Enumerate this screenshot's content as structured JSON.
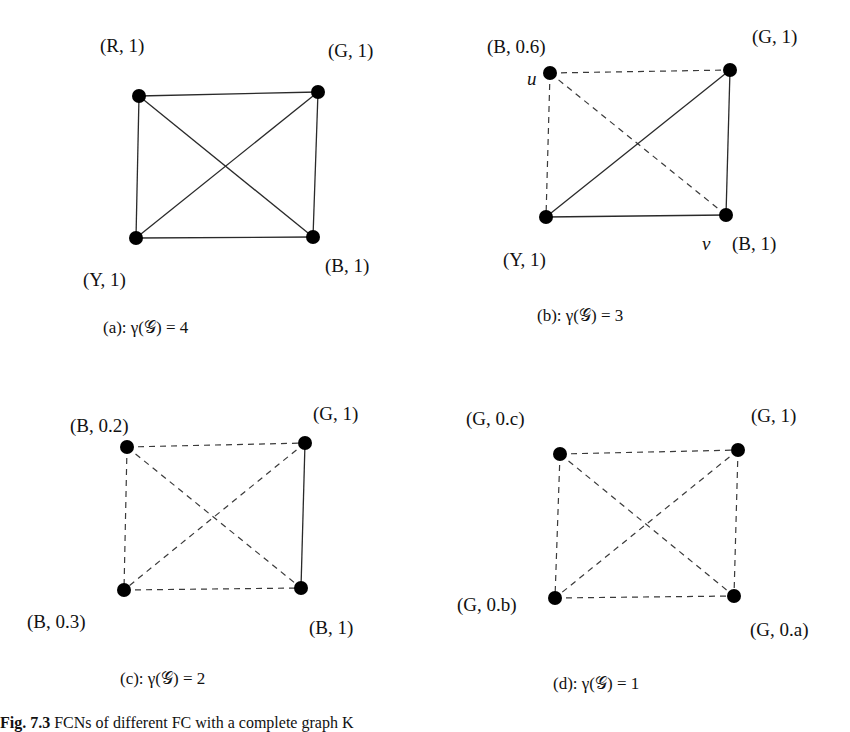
{
  "figure": {
    "caption_prefix": "Fig. 7.3",
    "caption_text": " FCNs of different FC with a complete graph K"
  },
  "panels": [
    {
      "id": "a",
      "caption": "(a): γ(𝒢) = 4",
      "nodes": [
        {
          "id": "tl",
          "x": 139,
          "y": 96,
          "label": "(R, 1)",
          "lx": 100,
          "ly": 52
        },
        {
          "id": "tr",
          "x": 318,
          "y": 92,
          "label": "(G, 1)",
          "lx": 328,
          "ly": 57
        },
        {
          "id": "bl",
          "x": 136,
          "y": 238,
          "label": "(Y, 1)",
          "lx": 83,
          "ly": 286
        },
        {
          "id": "br",
          "x": 313,
          "y": 237,
          "label": "(B, 1)",
          "lx": 325,
          "ly": 272
        }
      ],
      "edges": [
        {
          "from": "tl",
          "to": "tr",
          "style": "solid"
        },
        {
          "from": "tl",
          "to": "bl",
          "style": "solid"
        },
        {
          "from": "tl",
          "to": "br",
          "style": "solid"
        },
        {
          "from": "tr",
          "to": "bl",
          "style": "solid"
        },
        {
          "from": "tr",
          "to": "br",
          "style": "solid"
        },
        {
          "from": "bl",
          "to": "br",
          "style": "solid"
        }
      ],
      "caption_x": 103,
      "caption_y": 333
    },
    {
      "id": "b",
      "caption": "(b): γ(𝒢) = 3",
      "nodes": [
        {
          "id": "tl",
          "x": 550,
          "y": 73,
          "label": "(B, 0.6)",
          "lx": 487,
          "ly": 53,
          "extra": "u",
          "ex": 527,
          "ey": 85
        },
        {
          "id": "tr",
          "x": 730,
          "y": 70,
          "label": "(G, 1)",
          "lx": 752,
          "ly": 43
        },
        {
          "id": "bl",
          "x": 546,
          "y": 217,
          "label": "(Y, 1)",
          "lx": 503,
          "ly": 266
        },
        {
          "id": "br",
          "x": 726,
          "y": 215,
          "label": "(B, 1)",
          "lx": 732,
          "ly": 250,
          "extra": "v",
          "ex": 702,
          "ey": 250
        }
      ],
      "edges": [
        {
          "from": "tl",
          "to": "tr",
          "style": "dashed"
        },
        {
          "from": "tl",
          "to": "bl",
          "style": "dashed"
        },
        {
          "from": "tl",
          "to": "br",
          "style": "dashed"
        },
        {
          "from": "tr",
          "to": "bl",
          "style": "solid"
        },
        {
          "from": "tr",
          "to": "br",
          "style": "solid"
        },
        {
          "from": "bl",
          "to": "br",
          "style": "solid"
        }
      ],
      "caption_x": 537,
      "caption_y": 321
    },
    {
      "id": "c",
      "caption": "(c): γ(𝒢) = 2",
      "nodes": [
        {
          "id": "tl",
          "x": 127,
          "y": 447,
          "label": "(B, 0.2)",
          "lx": 70,
          "ly": 432
        },
        {
          "id": "tr",
          "x": 305,
          "y": 443,
          "label": "(G, 1)",
          "lx": 313,
          "ly": 420
        },
        {
          "id": "bl",
          "x": 124,
          "y": 590,
          "label": "(B, 0.3)",
          "lx": 27,
          "ly": 628
        },
        {
          "id": "br",
          "x": 301,
          "y": 588,
          "label": "(B, 1)",
          "lx": 309,
          "ly": 634
        }
      ],
      "edges": [
        {
          "from": "tl",
          "to": "tr",
          "style": "dashed"
        },
        {
          "from": "tl",
          "to": "bl",
          "style": "dashed"
        },
        {
          "from": "tl",
          "to": "br",
          "style": "dashed"
        },
        {
          "from": "tr",
          "to": "bl",
          "style": "dashed"
        },
        {
          "from": "tr",
          "to": "br",
          "style": "solid"
        },
        {
          "from": "bl",
          "to": "br",
          "style": "dashed"
        }
      ],
      "caption_x": 120,
      "caption_y": 684
    },
    {
      "id": "d",
      "caption": "(d): γ(𝒢) = 1",
      "nodes": [
        {
          "id": "tl",
          "x": 560,
          "y": 454,
          "label": "(G, 0.c)",
          "lx": 466,
          "ly": 425
        },
        {
          "id": "tr",
          "x": 738,
          "y": 450,
          "label": "(G, 1)",
          "lx": 751,
          "ly": 422
        },
        {
          "id": "bl",
          "x": 555,
          "y": 598,
          "label": "(G, 0.b)",
          "lx": 457,
          "ly": 611
        },
        {
          "id": "br",
          "x": 734,
          "y": 596,
          "label": "(G, 0.a)",
          "lx": 750,
          "ly": 636
        }
      ],
      "edges": [
        {
          "from": "tl",
          "to": "tr",
          "style": "dashed"
        },
        {
          "from": "tl",
          "to": "bl",
          "style": "dashed"
        },
        {
          "from": "tl",
          "to": "br",
          "style": "dashed"
        },
        {
          "from": "tr",
          "to": "bl",
          "style": "dashed"
        },
        {
          "from": "tr",
          "to": "br",
          "style": "dashed"
        },
        {
          "from": "bl",
          "to": "br",
          "style": "dashed"
        }
      ],
      "caption_x": 553,
      "caption_y": 689
    }
  ]
}
